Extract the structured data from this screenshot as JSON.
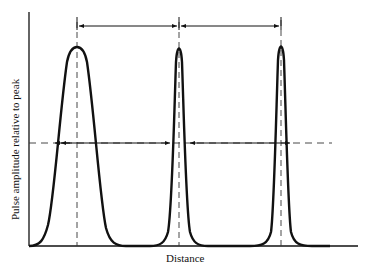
{
  "figure": {
    "xlabel": "Distance",
    "ylabel": "Pulse amplitude relative to peak",
    "colors": {
      "ink": "#111111",
      "dash": "#333333",
      "background": "#ffffff"
    },
    "pulses": [
      {
        "name": "pulse-1",
        "center_x": 77,
        "half_width": 15
      },
      {
        "name": "pulse-2",
        "center_x": 179,
        "half_width": 10
      },
      {
        "name": "pulse-3",
        "center_x": 281,
        "half_width": 6
      }
    ],
    "annotations": {
      "top_spacing_arrows": [
        "pulse-1 to pulse-2 spacing",
        "pulse-2 to pulse-3 spacing"
      ],
      "half_max_line": "dashed horizontal reference line at half amplitude"
    }
  }
}
